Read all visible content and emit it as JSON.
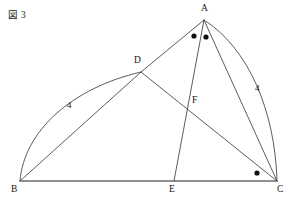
{
  "figure": {
    "caption": "図 3",
    "width": 294,
    "height": 201,
    "background_color": "#ffffff",
    "stroke_color": "#4a4a4a",
    "baseline_color": "#6b6b6b",
    "marker_color": "#111111",
    "text_color": "#141414"
  },
  "points": [
    {
      "id": "A",
      "label": "A",
      "x": 204,
      "y": 20,
      "label_x": 201,
      "label_y": 4
    },
    {
      "id": "B",
      "label": "B",
      "x": 20,
      "y": 181,
      "label_x": 11,
      "label_y": 185
    },
    {
      "id": "C",
      "label": "C",
      "x": 277,
      "y": 181,
      "label_x": 277,
      "label_y": 185
    },
    {
      "id": "D",
      "label": "D",
      "x": 141,
      "y": 72,
      "label_x": 134,
      "label_y": 56
    },
    {
      "id": "E",
      "label": "E",
      "x": 174,
      "y": 181,
      "label_x": 169,
      "label_y": 185
    },
    {
      "id": "F",
      "label": "F",
      "x": 192,
      "y": 110,
      "label_x": 192,
      "label_y": 96
    }
  ],
  "segments": [
    {
      "name": "segment-BC",
      "from": "B",
      "to": "C",
      "style": "baseline"
    },
    {
      "name": "segment-BD",
      "from": "B",
      "to": "D",
      "style": "thin"
    },
    {
      "name": "segment-DA",
      "from": "D",
      "to": "A",
      "style": "thin"
    },
    {
      "name": "segment-AE",
      "from": "A",
      "to": "E",
      "style": "thin"
    },
    {
      "name": "segment-AC",
      "from": "A",
      "to": "C",
      "style": "thin"
    },
    {
      "name": "segment-DC",
      "from": "D",
      "to": "C",
      "style": "thin"
    }
  ],
  "arcs": [
    {
      "name": "arc-BD",
      "from": "B",
      "to": "D",
      "path": "M 20 181 C 24 131 72 88 141 72",
      "measure": "4",
      "measure_x": 67,
      "measure_y": 101
    },
    {
      "name": "arc-AC",
      "from": "A",
      "to": "C",
      "path": "M 204 20 C 248 48 275 110 277 181",
      "measure": "4",
      "measure_x": 255,
      "measure_y": 84
    }
  ],
  "angle_markers": [
    {
      "name": "angle-marker-BAE",
      "at": "A",
      "x": 194,
      "y": 36,
      "r": 2.6
    },
    {
      "name": "angle-marker-EAC",
      "at": "A",
      "x": 206,
      "y": 37,
      "r": 2.6
    },
    {
      "name": "angle-marker-ACB",
      "at": "C",
      "x": 257,
      "y": 173,
      "r": 2.6
    }
  ]
}
